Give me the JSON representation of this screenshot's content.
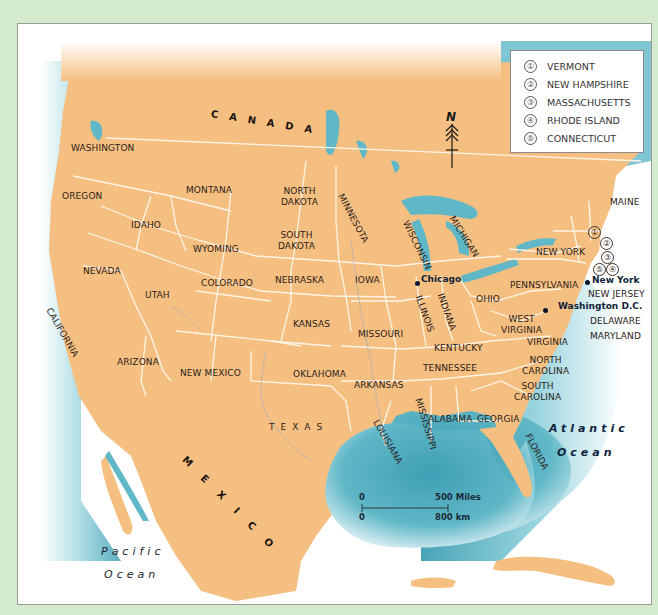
{
  "map": {
    "colors": {
      "page_background": "#d4ebcf",
      "land": "#f6bf82",
      "water": "#5fb7c7",
      "deep_water": "#3f9fb4",
      "border": "#fff5e6",
      "frame": "#9a9a9a"
    },
    "countries": {
      "canada": "CANADA",
      "mexico": "MEXICO"
    },
    "oceans": {
      "pacific_line1": "Pacific",
      "pacific_line2": "Ocean",
      "atlantic_line1": "Atlantic",
      "atlantic_line2": "Ocean"
    },
    "states": {
      "washington": "WASHINGTON",
      "oregon": "OREGON",
      "california": "CALIFORNIA",
      "idaho": "IDAHO",
      "nevada": "NEVADA",
      "utah": "UTAH",
      "arizona": "ARIZONA",
      "montana": "MONTANA",
      "wyoming": "WYOMING",
      "colorado": "COLORADO",
      "new_mexico": "NEW MEXICO",
      "north_dakota_1": "NORTH",
      "north_dakota_2": "DAKOTA",
      "south_dakota_1": "SOUTH",
      "south_dakota_2": "DAKOTA",
      "nebraska": "NEBRASKA",
      "kansas": "KANSAS",
      "oklahoma": "OKLAHOMA",
      "texas": "TEXAS",
      "minnesota": "MINNESOTA",
      "iowa": "IOWA",
      "missouri": "MISSOURI",
      "arkansas": "ARKANSAS",
      "louisiana": "LOUISIANA",
      "wisconsin": "WISCONSIN",
      "illinois": "ILLINOIS",
      "mississippi": "MISSISSIPPI",
      "michigan": "MICHIGAN",
      "indiana": "INDIANA",
      "kentucky": "KENTUCKY",
      "tennessee": "TENNESSEE",
      "alabama": "ALABAMA",
      "ohio": "OHIO",
      "georgia": "GEORGIA",
      "florida": "FLORIDA",
      "west_virginia_1": "WEST",
      "west_virginia_2": "VIRGINIA",
      "virginia": "VIRGINIA",
      "north_carolina_1": "NORTH",
      "north_carolina_2": "CAROLINA",
      "south_carolina_1": "SOUTH",
      "south_carolina_2": "CAROLINA",
      "pennsylvania": "PENNSYLVANIA",
      "new_york": "NEW YORK",
      "new_jersey": "NEW JERSEY",
      "delaware": "DELAWARE",
      "maryland": "MARYLAND",
      "maine": "MAINE"
    },
    "cities": {
      "chicago": "Chicago",
      "new_york": "New York",
      "washington_dc": "Washington D.C."
    },
    "numbered_markers": [
      "①",
      "②",
      "③",
      "④",
      "⑤"
    ],
    "legend": {
      "items": [
        {
          "num": "①",
          "label": "VERMONT"
        },
        {
          "num": "②",
          "label": "NEW HAMPSHIRE"
        },
        {
          "num": "③",
          "label": "MASSACHUSETTS"
        },
        {
          "num": "④",
          "label": "RHODE ISLAND"
        },
        {
          "num": "⑤",
          "label": "CONNECTICUT"
        }
      ]
    },
    "scale_bar": {
      "top_zero": "0",
      "top_end": "500 Miles",
      "bottom_zero": "0",
      "bottom_end": "800 km"
    },
    "compass": {
      "north_label": "N"
    }
  }
}
